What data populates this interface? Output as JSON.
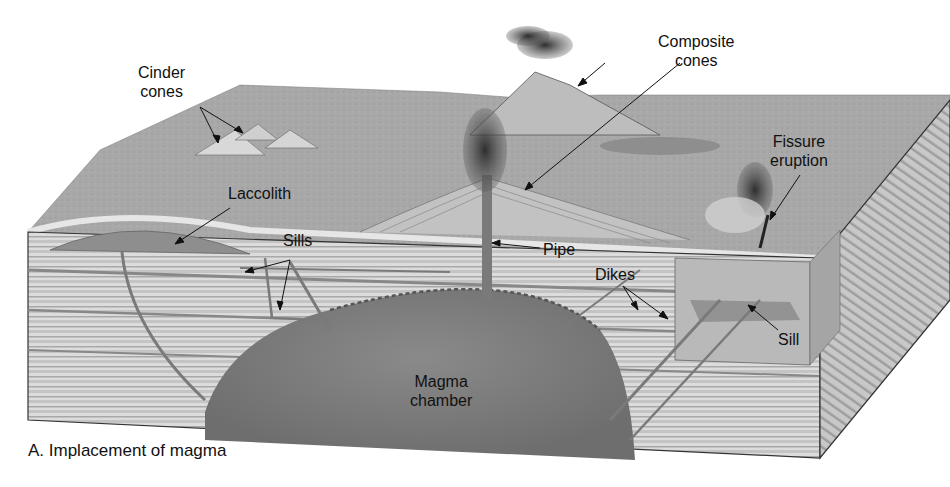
{
  "figure": {
    "caption": "A. Implacement of magma",
    "labels": {
      "cinder_cones_line1": "Cinder",
      "cinder_cones_line2": "cones",
      "composite_cones_line1": "Composite",
      "composite_cones_line2": "cones",
      "fissure_eruption_line1": "Fissure",
      "fissure_eruption_line2": "eruption",
      "laccolith": "Laccolith",
      "sills": "Sills",
      "pipe": "Pipe",
      "dikes": "Dikes",
      "sill": "Sill",
      "magma_chamber_line1": "Magma",
      "magma_chamber_line2": "chamber"
    },
    "colors": {
      "background": "#ffffff",
      "surface": "#a9a9a9",
      "strata_light": "#dcdcdc",
      "strata_dark": "#9a9a9a",
      "magma": "#7c7c7c",
      "smoke": "#3a3a3a",
      "text": "#111111"
    }
  }
}
